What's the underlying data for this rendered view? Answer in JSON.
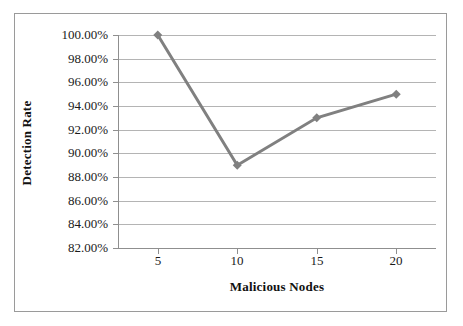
{
  "chart_data": {
    "type": "line",
    "title": "",
    "xlabel": "Malicious Nodes",
    "ylabel": "Detection Rate",
    "categories": [
      5,
      10,
      15,
      20
    ],
    "x_tick_labels": [
      "5",
      "10",
      "15",
      "20"
    ],
    "values": [
      1.0,
      0.89,
      0.93,
      0.95
    ],
    "value_labels": [
      "100.00%",
      "89.00%",
      "93.00%",
      "95.00%"
    ],
    "series": [
      {
        "name": "Detection Rate",
        "values": [
          1.0,
          0.89,
          0.93,
          0.95
        ]
      }
    ],
    "ylim": [
      0.82,
      1.0
    ],
    "y_tick_values": [
      1.0,
      0.98,
      0.96,
      0.94,
      0.92,
      0.9,
      0.88,
      0.86,
      0.84,
      0.82
    ],
    "y_tick_labels": [
      "100.00%",
      "98.00%",
      "96.00%",
      "94.00%",
      "92.00%",
      "90.00%",
      "88.00%",
      "86.00%",
      "84.00%",
      "82.00%"
    ],
    "grid": true,
    "grid_axis": "y",
    "legend": false,
    "legend_position": "none",
    "marker": "diamond",
    "series_color": "#808080",
    "grid_color": "#b4b4b4",
    "axis_color": "#8f8f8f",
    "background_color": "#ffffff",
    "frame_color": "#9a9a9a"
  }
}
